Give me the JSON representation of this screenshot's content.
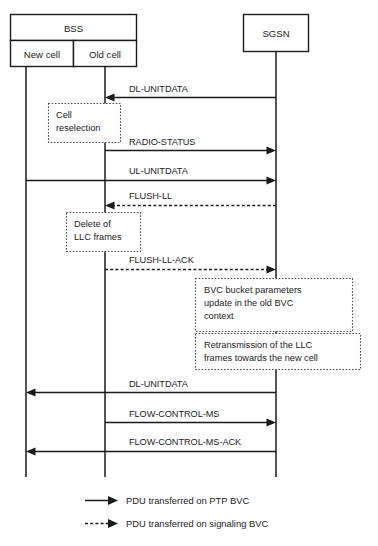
{
  "diagram": {
    "type": "sequence-diagram",
    "title": "",
    "nodes": [
      {
        "id": "bss",
        "label": "BSS",
        "kind": "group-header"
      },
      {
        "id": "new_cell",
        "label": "New cell",
        "kind": "lifeline",
        "parent": "bss"
      },
      {
        "id": "old_cell",
        "label": "Old cell",
        "kind": "lifeline",
        "parent": "bss"
      },
      {
        "id": "sgsn",
        "label": "SGSN",
        "kind": "lifeline"
      }
    ],
    "messages": [
      {
        "seq": 1,
        "label": "DL-UNITDATA",
        "from": "sgsn",
        "to": "old_cell",
        "style": "solid",
        "direction": "left"
      },
      {
        "seq": 2,
        "label": "RADIO-STATUS",
        "from": "old_cell",
        "to": "sgsn",
        "style": "solid",
        "direction": "right"
      },
      {
        "seq": 3,
        "label": "UL-UNITDATA",
        "from": "new_cell",
        "to": "sgsn",
        "style": "solid",
        "direction": "right"
      },
      {
        "seq": 4,
        "label": "FLUSH-LL",
        "from": "sgsn",
        "to": "old_cell",
        "style": "dashed",
        "direction": "left"
      },
      {
        "seq": 5,
        "label": "FLUSH-LL-ACK",
        "from": "old_cell",
        "to": "sgsn",
        "style": "dashed",
        "direction": "right"
      },
      {
        "seq": 6,
        "label": "DL-UNITDATA",
        "from": "sgsn",
        "to": "new_cell",
        "style": "solid",
        "direction": "left"
      },
      {
        "seq": 7,
        "label": "FLOW-CONTROL-MS",
        "from": "old_cell",
        "to": "sgsn",
        "style": "solid",
        "direction": "right"
      },
      {
        "seq": 8,
        "label": "FLOW-CONTROL-MS-ACK",
        "from": "sgsn",
        "to": "new_cell",
        "style": "solid",
        "direction": "left"
      }
    ],
    "notes": [
      {
        "id": "note_cell_reselection",
        "lines": [
          "Cell",
          "reselection"
        ],
        "on": "old_cell"
      },
      {
        "id": "note_delete_llc",
        "lines": [
          "Delete of",
          "LLC frames"
        ],
        "on": "old_cell"
      },
      {
        "id": "note_bvc_bucket",
        "lines": [
          "BVC bucket parameters",
          "update in the old BVC",
          "context"
        ],
        "on": "sgsn"
      },
      {
        "id": "note_retransmission",
        "lines": [
          "Retransmission of the LLC",
          "frames towards the new cell"
        ],
        "on": "sgsn"
      }
    ],
    "legend": [
      {
        "style": "solid",
        "label": "PDU transferred on PTP BVC"
      },
      {
        "style": "dashed",
        "label": "PDU transferred on signaling BVC"
      }
    ],
    "colors": {
      "stroke": "#1b1b1b",
      "note_stroke": "#4d4d4d",
      "background": "#ffffff"
    }
  }
}
